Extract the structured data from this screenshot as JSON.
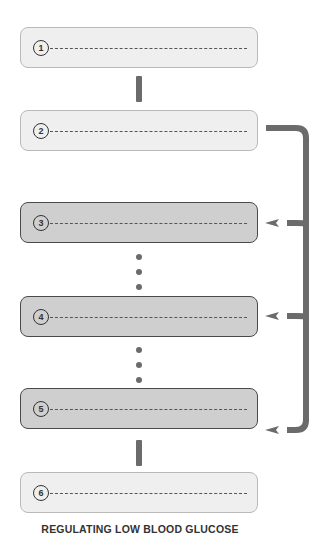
{
  "diagram": {
    "title": "REGULATING LOW BLOOD GLUCOSE",
    "steps": [
      {
        "number": "1",
        "shade": "light"
      },
      {
        "number": "2",
        "shade": "light"
      },
      {
        "number": "3",
        "shade": "dark"
      },
      {
        "number": "4",
        "shade": "dark"
      },
      {
        "number": "5",
        "shade": "dark"
      },
      {
        "number": "6",
        "shade": "light"
      }
    ],
    "colors": {
      "light_box": "#efefef",
      "dark_box": "#cfcfcf",
      "connector": "#6b6b6b"
    }
  }
}
